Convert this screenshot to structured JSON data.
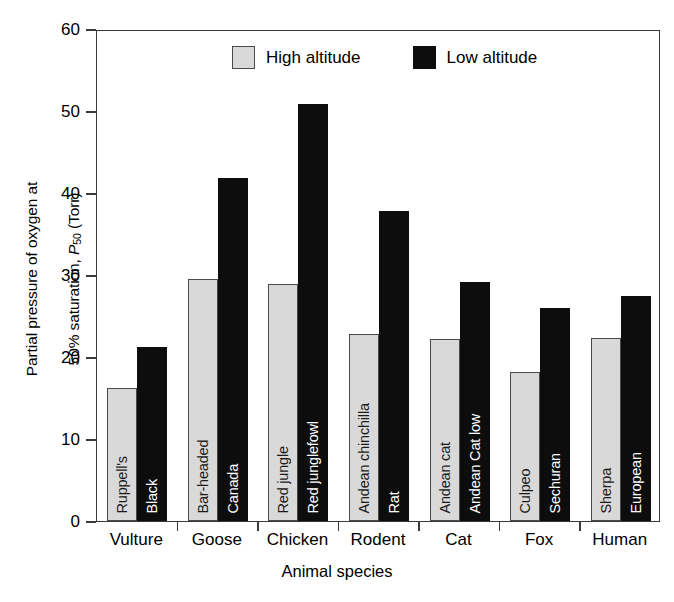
{
  "chart_data": {
    "type": "bar",
    "title": "",
    "xlabel": "Animal species",
    "ylabel_line1": "Partial pressure of oxygen at",
    "ylabel_line2_pre": "50% saturation, ",
    "ylabel_symbol": "P",
    "ylabel_sub": "50",
    "ylabel_line2_post": " (Torr)",
    "ylim": [
      0,
      60
    ],
    "yticks": [
      0,
      10,
      20,
      30,
      40,
      50,
      60
    ],
    "ytick_labels": [
      "0",
      "10",
      "20",
      "30",
      "40",
      "50",
      "60"
    ],
    "grid": false,
    "legend_position": "top-center",
    "categories": [
      "Vulture",
      "Goose",
      "Chicken",
      "Rodent",
      "Cat",
      "Fox",
      "Human"
    ],
    "series": [
      {
        "name": "High altitude",
        "color": "#d9d9d9",
        "values": [
          16.2,
          29.5,
          28.9,
          22.8,
          22.2,
          18.2,
          22.3
        ],
        "bar_labels": [
          "Ruppell's",
          "Bar-headed",
          "Red jungle",
          "Andean chinchilla",
          "Andean cat",
          "Culpeo",
          "Sherpa"
        ]
      },
      {
        "name": "Low altitude",
        "color": "#0d0d0d",
        "values": [
          21.2,
          41.8,
          50.9,
          37.8,
          29.1,
          26.0,
          27.5
        ],
        "bar_labels": [
          "Black",
          "Canada",
          "Red junglefowl",
          "Rat",
          "Andean Cat low",
          "Sechuran",
          "European"
        ]
      }
    ]
  },
  "legend": {
    "items": [
      {
        "label": "High altitude",
        "swatch": "high"
      },
      {
        "label": "Low altitude",
        "swatch": "low"
      }
    ]
  }
}
